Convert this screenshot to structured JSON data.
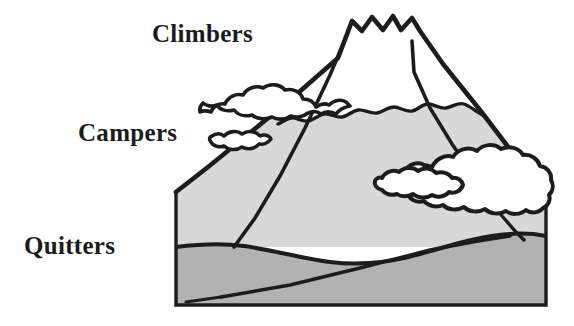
{
  "diagram": {
    "title_text": "",
    "type": "mountain-stages-illustration",
    "labels": [
      {
        "id": "climbers",
        "text": "Climbers",
        "tier": "summit"
      },
      {
        "id": "campers",
        "text": "Campers",
        "tier": "mid-slope"
      },
      {
        "id": "quitters",
        "text": "Quitters",
        "tier": "foothills"
      }
    ],
    "shapes": {
      "mountain_body_name": "mountain-slope",
      "snowcap_name": "summit-snowcap",
      "foothills_name": "foothills",
      "frame_name": "diagram-frame",
      "clouds": [
        {
          "id": "upper-left-cloud",
          "position": "upper-left"
        },
        {
          "id": "lower-left-wisp",
          "position": "mid-left"
        },
        {
          "id": "right-cloud-large",
          "position": "mid-right"
        },
        {
          "id": "right-cloud-wisp",
          "position": "mid-right-lower"
        }
      ]
    },
    "colors": {
      "background": "#ffffff",
      "outline": "#1c1c1c",
      "mountain_fill": "#d8d8d8",
      "foothills_fill": "#b2b2b2",
      "snow_fill": "#ffffff",
      "cloud_fill": "#ffffff",
      "label_color": "#1c1c1c"
    }
  }
}
